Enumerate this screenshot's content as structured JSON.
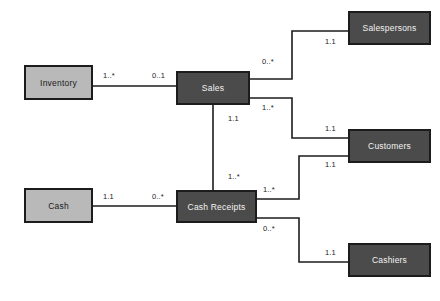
{
  "diagram": {
    "background_color": "#ffffff",
    "colors": {
      "resource_fill": "#b9b9b9",
      "event_agent_fill": "#4b4b4b",
      "border": "#1c1c1c",
      "line": "#1c1c1c",
      "dark_text": "#1a1a1a",
      "light_text": "#f2f2f2"
    },
    "entities": [
      {
        "id": "inventory",
        "label": "Inventory",
        "style": "light",
        "x": 24,
        "y": 65,
        "w": 69,
        "h": 35
      },
      {
        "id": "cash",
        "label": "Cash",
        "style": "light",
        "x": 24,
        "y": 188,
        "w": 69,
        "h": 35
      },
      {
        "id": "sales",
        "label": "Sales",
        "style": "dark",
        "x": 176,
        "y": 71,
        "w": 74,
        "h": 34
      },
      {
        "id": "cash_receipts",
        "label": "Cash Receipts",
        "style": "dark",
        "x": 176,
        "y": 190,
        "w": 81,
        "h": 33
      },
      {
        "id": "salespersons",
        "label": "Salespersons",
        "style": "dark",
        "x": 348,
        "y": 11,
        "w": 83,
        "h": 34
      },
      {
        "id": "customers",
        "label": "Customers",
        "style": "dark",
        "x": 348,
        "y": 129,
        "w": 83,
        "h": 34
      },
      {
        "id": "cashiers",
        "label": "Cashiers",
        "style": "dark",
        "x": 348,
        "y": 243,
        "w": 83,
        "h": 34
      }
    ],
    "relationships": [
      {
        "id": "inventory-sales",
        "from": "inventory",
        "to": "sales",
        "source_multiplicity": "1..*",
        "target_multiplicity": "0..1",
        "path": "M 93 86 L 176 86"
      },
      {
        "id": "sales-salespersons",
        "from": "sales",
        "to": "salespersons",
        "source_multiplicity": "0..*",
        "target_multiplicity": "1.1",
        "path": "M 250 79 L 292 79 L 292 31 L 348 31"
      },
      {
        "id": "sales-customers",
        "from": "sales",
        "to": "customers",
        "source_multiplicity": "1..*",
        "target_multiplicity": "1.1",
        "path": "M 250 98 L 292 98 L 292 138 L 348 138"
      },
      {
        "id": "sales-cashreceipts",
        "from": "sales",
        "to": "cash_receipts",
        "source_multiplicity": "1.1",
        "target_multiplicity": "1..*",
        "path": "M 213 105 L 213 190"
      },
      {
        "id": "cash-cashreceipts",
        "from": "cash",
        "to": "cash_receipts",
        "source_multiplicity": "1.1",
        "target_multiplicity": "0..*",
        "path": "M 93 206 L 176 206"
      },
      {
        "id": "cashreceipts-customers",
        "from": "cash_receipts",
        "to": "customers",
        "source_multiplicity": "1..*",
        "target_multiplicity": "1.1",
        "path": "M 257 199 L 299 199 L 299 156 L 348 156"
      },
      {
        "id": "cashreceipts-cashiers",
        "from": "cash_receipts",
        "to": "cashiers",
        "source_multiplicity": "0..*",
        "target_multiplicity": "1.1",
        "path": "M 257 218 L 299 218 L 299 262 L 348 262"
      }
    ],
    "multiplicity_labels": [
      {
        "id": "m-inventory-out",
        "text": "1..*",
        "x": 103,
        "y": 71
      },
      {
        "id": "m-sales-in-inventory",
        "text": "0..1",
        "x": 152,
        "y": 71
      },
      {
        "id": "m-sales-out-sp",
        "text": "0..*",
        "x": 262,
        "y": 57
      },
      {
        "id": "m-sp-in",
        "text": "1.1",
        "x": 325,
        "y": 37
      },
      {
        "id": "m-sales-out-cust",
        "text": "1..*",
        "x": 262,
        "y": 103
      },
      {
        "id": "m-cust-in-sales",
        "text": "1.1",
        "x": 325,
        "y": 124
      },
      {
        "id": "m-sales-down",
        "text": "1.1",
        "x": 228,
        "y": 114
      },
      {
        "id": "m-cr-up",
        "text": "1..*",
        "x": 228,
        "y": 172
      },
      {
        "id": "m-cash-out",
        "text": "1.1",
        "x": 103,
        "y": 192
      },
      {
        "id": "m-cr-in-cash",
        "text": "0..*",
        "x": 152,
        "y": 192
      },
      {
        "id": "m-cust-in-cr",
        "text": "1.1",
        "x": 325,
        "y": 160
      },
      {
        "id": "m-cr-out-cust",
        "text": "1..*",
        "x": 263,
        "y": 185
      },
      {
        "id": "m-cr-out-cashier",
        "text": "0..*",
        "x": 263,
        "y": 224
      },
      {
        "id": "m-cashier-in",
        "text": "1.1",
        "x": 325,
        "y": 248
      }
    ]
  }
}
